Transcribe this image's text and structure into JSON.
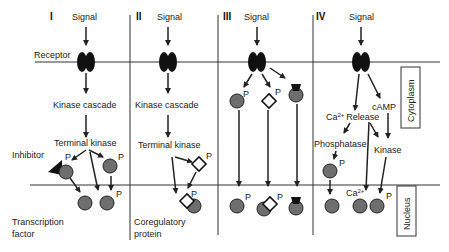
{
  "figure": {
    "panels": [
      {
        "id": "I",
        "numeral": "I",
        "signal": "Signal",
        "receptor_label": "Receptor",
        "step1": "Kinase cascade",
        "step2": "Terminal kinase",
        "inhibitor": "Inhibitor",
        "nucleus_label_1": "Transcription",
        "nucleus_label_2": "factor",
        "phospho": "P"
      },
      {
        "id": "II",
        "numeral": "II",
        "signal": "Signal",
        "step1": "Kinase cascade",
        "step2": "Terminal kinase",
        "nucleus_label_1": "Coregulatory",
        "nucleus_label_2": "protein",
        "phospho": "P"
      },
      {
        "id": "III",
        "numeral": "III",
        "signal": "Signal",
        "phospho": "P"
      },
      {
        "id": "IV",
        "numeral": "IV",
        "signal": "Signal",
        "ca_release": "Ca2+ Release",
        "ca_base": "Ca",
        "ca_sup": "2+",
        "release": "Release",
        "camp": "cAMP",
        "phosphatase": "Phosphatase",
        "kinase": "Kinase",
        "phospho": "P"
      }
    ],
    "compartments": {
      "cytoplasm": "Cytoplasm",
      "nucleus": "Nucleus"
    },
    "colors": {
      "line": "#222222",
      "receptor": "#111111",
      "protein_fill": "#6e6e6e",
      "protein_stroke": "#222222",
      "background": "#ffffff"
    }
  }
}
